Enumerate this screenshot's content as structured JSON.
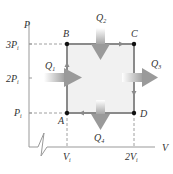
{
  "diagram": {
    "axes": {
      "y_label": "P",
      "x_label": "V",
      "y_ticks": [
        "3P",
        "2P",
        "P"
      ],
      "y_tick_sub": "i",
      "x_ticks": [
        "V",
        "2V"
      ],
      "x_tick_sub": "i"
    },
    "points": [
      {
        "name": "A",
        "label": "A"
      },
      {
        "name": "B",
        "label": "B"
      },
      {
        "name": "C",
        "label": "C"
      },
      {
        "name": "D",
        "label": "D"
      }
    ],
    "heat_flows": [
      {
        "id": "Q1",
        "main": "Q",
        "sub": "1",
        "direction": "in-right"
      },
      {
        "id": "Q2",
        "main": "Q",
        "sub": "2",
        "direction": "in-down"
      },
      {
        "id": "Q3",
        "main": "Q",
        "sub": "3",
        "direction": "out-right"
      },
      {
        "id": "Q4",
        "main": "Q",
        "sub": "4",
        "direction": "out-down"
      }
    ],
    "colors": {
      "axis": "#9a9a9a",
      "cycle_edge": "#8a8a8a",
      "fill": "#f0f0f0",
      "arrow": "#9d9d9d",
      "point": "#111111"
    }
  }
}
